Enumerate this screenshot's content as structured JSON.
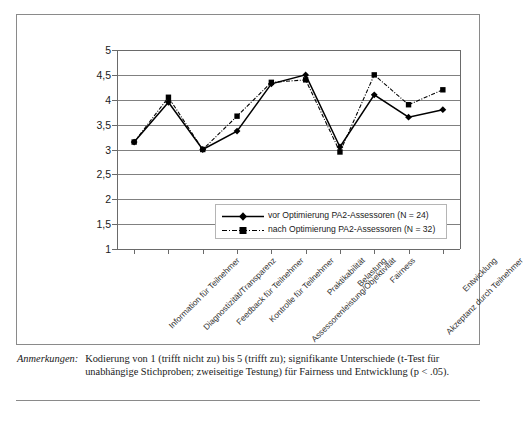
{
  "chart_data": {
    "type": "line",
    "title": "",
    "xlabel": "",
    "ylabel": "",
    "ylim": [
      1,
      5
    ],
    "ytick_labels": [
      "5",
      "4,5",
      "4",
      "3,5",
      "3",
      "2,5",
      "2",
      "1,5",
      "1"
    ],
    "ytick_values": [
      5,
      4.5,
      4,
      3.5,
      3,
      2.5,
      2,
      1.5,
      1
    ],
    "grid": true,
    "legend_position": "inside-lower-right",
    "categories": [
      "Information für Teilnehmer",
      "Diagnostizität/Transparenz",
      "Feedback für Teilnehmer",
      "Kontrolle für Teilnehmer",
      "Assessorenleistung/Objektivität",
      "Praktikabilität",
      "Belastung",
      "Fairness",
      "Akzeptanz durch Teilnehmer",
      "Entwicklung"
    ],
    "series": [
      {
        "name": "vor Optimierung PA2-Assessoren (N = 24)",
        "marker": "diamond",
        "linestyle": "solid",
        "color": "#000000",
        "values": [
          3.15,
          3.95,
          3.0,
          3.37,
          4.32,
          4.5,
          3.05,
          4.1,
          3.65,
          3.8
        ]
      },
      {
        "name": "nach Optimierung PA2-Assessoren (N = 32)",
        "marker": "square",
        "linestyle": "dash-dot",
        "color": "#000000",
        "values": [
          3.15,
          4.05,
          3.0,
          3.67,
          4.35,
          4.4,
          2.95,
          4.5,
          3.9,
          4.2
        ]
      }
    ]
  },
  "legend": {
    "items": [
      {
        "label": "vor Optimierung PA2-Assessoren (N = 24)",
        "marker": "diamond",
        "linestyle": "solid"
      },
      {
        "label": "nach Optimierung PA2-Assessoren (N = 32)",
        "marker": "square",
        "linestyle": "dash-dot"
      }
    ]
  },
  "note": {
    "label": "Anmerkungen:",
    "body": "Kodierung von 1 (trifft nicht zu) bis 5 (trifft zu); signifikante Unterschiede (t-Test für unabhängige Stichproben; zweiseitige Testung) für Fairness und Entwicklung (p < .05)."
  }
}
